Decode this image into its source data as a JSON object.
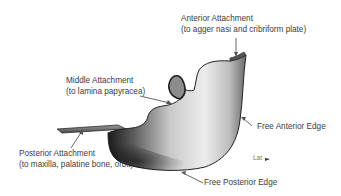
{
  "figure": {
    "labels": {
      "anterior_attachment": {
        "title": "Anterior Attachment",
        "detail": "(to agger nasi and cribriform plate)"
      },
      "middle_attachment": {
        "title": "Middle Attachment",
        "detail": "(to lamina papyracea)"
      },
      "posterior_attachment": {
        "title": "Posterior Attachment",
        "detail": "(to maxilla, palatine bone, orbit)"
      },
      "free_anterior_edge": "Free Anterior Edge",
      "free_posterior_edge": "Free Posterior Edge"
    },
    "orientation_marker": "Lat"
  },
  "colors": {
    "background": "#ffffff",
    "text": "#3c3c3c",
    "arrow": "#555555",
    "surface_light": "#e8e8e8",
    "surface_dark": "#1e1e1e"
  }
}
